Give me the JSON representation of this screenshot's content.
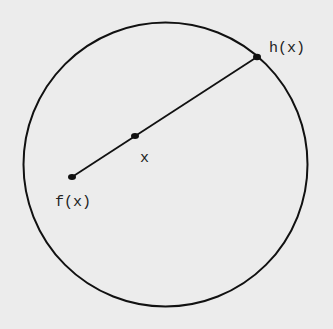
{
  "diagram": {
    "background": "#ececec",
    "stroke_color": "#111111",
    "circle": {
      "cx": 165.5,
      "cy": 164.5,
      "r": 142
    },
    "segment": {
      "from": "f(x)",
      "to": "h(x)"
    },
    "points": [
      {
        "id": "fx",
        "label": "f(x)",
        "x": 72,
        "y": 177
      },
      {
        "id": "x",
        "label": "x",
        "x": 135,
        "y": 136
      },
      {
        "id": "hx",
        "label": "h(x)",
        "x": 257,
        "y": 57
      }
    ]
  }
}
